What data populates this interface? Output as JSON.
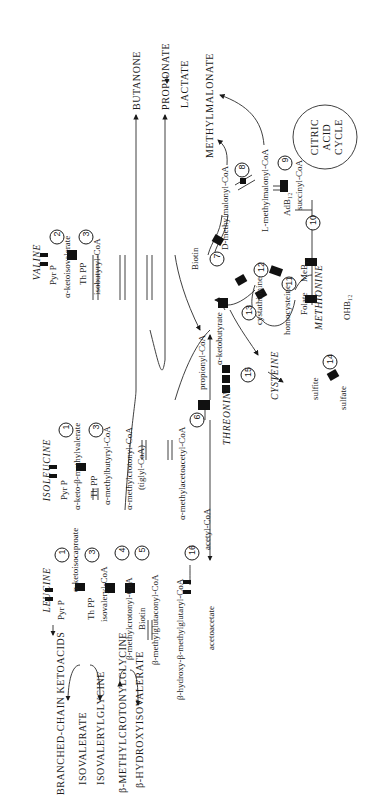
{
  "diagram": {
    "orientation": "rotated-90-ccw",
    "amino_acids": {
      "leucine": "LEUCINE",
      "isoleucine": "ISOLEUCINE",
      "valine": "VALINE",
      "threonine": "THREONINE",
      "methionine": "METHIONINE",
      "cysteine": "CYSTEINE"
    },
    "leucine_pathway": {
      "cofactor_1": "Pyr P",
      "step_1": "1",
      "ketoacid": "α-ketoisocaproate",
      "cofactor_3": "Th PP",
      "step_3": "3",
      "acyl_coa": "isovaleryl-CoA",
      "step_4": "4",
      "crotonyl": "β-methylcrotonyl-CoA",
      "cofactor_5": "Biotin",
      "step_5": "5",
      "glutaconyl": "β-methylglutaconyl-CoA",
      "hmg": "β-hydroxy-β-methylglutaryl-CoA",
      "step_16": "16",
      "acetoacetate": "acetoacetate",
      "acetyl_coa": "acetyl-CoA"
    },
    "isoleucine_pathway": {
      "cofactor_1": "Pyr P",
      "step_1": "1",
      "ketoacid": "α-keto-β-methylvalerate",
      "cofactor_3": "Th PP",
      "step_3": "3",
      "butyryl": "α-methylbutyryl-CoA",
      "crotonyl": "α-methylcrotonyl-CoA",
      "tiglyl": "(tiglyl-CoA)",
      "acetoacetyl": "α-methylacetoacetyl-CoA",
      "step_6": "6"
    },
    "valine_pathway": {
      "cofactor_2": "Pyr P",
      "step_2": "2",
      "ketoacid": "α-ketoisovalerate",
      "cofactor_3": "Th PP",
      "step_3": "3",
      "acyl_coa": "isobutyryl-CoA"
    },
    "propionate_pathway": {
      "propionyl": "propionyl-CoA",
      "cofactor_7": "Biotin",
      "step_7": "7",
      "d_methylmalonyl": "D-methylmalonyl-CoA",
      "step_8": "8",
      "l_methylmalonyl": "L-methylmalonyl-CoA",
      "cofactor_9": "AdB₁₂",
      "step_9": "9",
      "succinyl": "succinyl-CoA",
      "step_10": "10",
      "ohb12": "OHB₁₂",
      "step_11": "11",
      "folate": "Folate",
      "meb12": "MeB₁₂",
      "homocysteine": "homocysteine",
      "step_12": "12",
      "cystathionine": "cystathionine",
      "step_13": "13",
      "ketobutyrate": "α-ketobutyrate",
      "step_15": "15",
      "sulfite": "sulfite",
      "step_14": "14",
      "sulfate": "sulfate"
    },
    "tca": {
      "line1": "CITRIC",
      "line2": "ACID",
      "line3": "CYCLE"
    },
    "excretion_products": {
      "bcka": "BRANCHED-CHAIN KETOACIDS",
      "isovalerate": "ISOVALERATE",
      "isovalerylglycine": "ISOVALERYLGLYCINE",
      "mcg": "β-METHYLCROTONYLGLYCINE",
      "hiva": "β-HYDROXYISOVALERATE",
      "butanone": "BUTANONE",
      "propionate": "PROPIONATE",
      "lactate": "LACTATE",
      "methylmalonate": "METHYLMALONATE"
    }
  }
}
